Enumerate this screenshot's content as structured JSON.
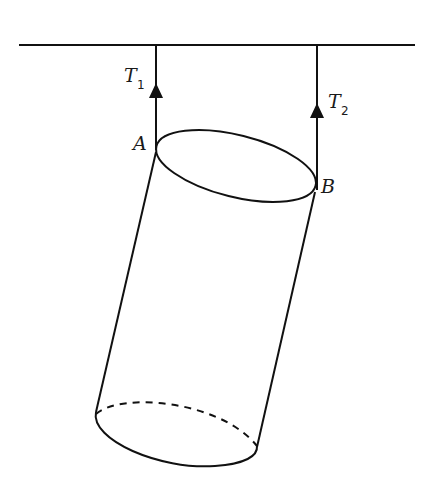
{
  "diagram": {
    "labels": {
      "tension1": {
        "symbol": "T",
        "subscript": "1"
      },
      "tension2": {
        "symbol": "T",
        "subscript": "2"
      },
      "pointA": "A",
      "pointB": "B"
    },
    "colors": {
      "stroke": "#111111",
      "background": "#ffffff"
    }
  }
}
